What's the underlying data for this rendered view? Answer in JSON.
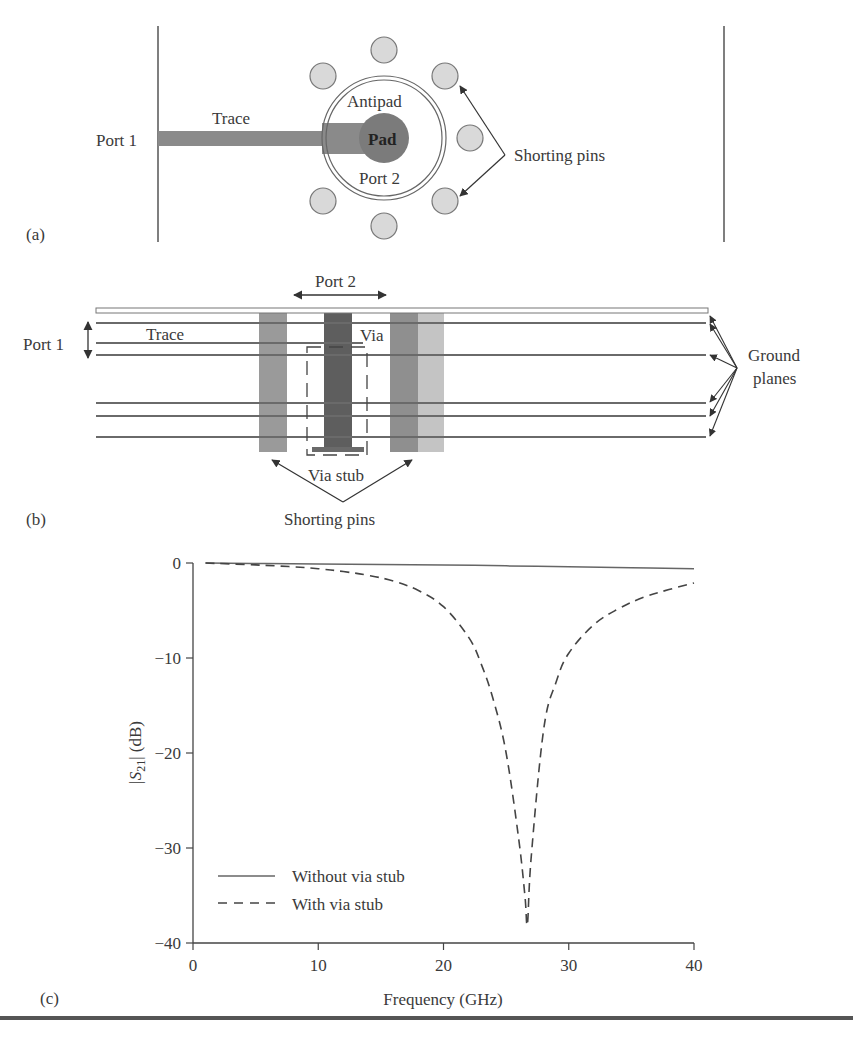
{
  "panel_a": {
    "label": "(a)",
    "port1": "Port 1",
    "trace": "Trace",
    "antipad": "Antipad",
    "pad": "Pad",
    "port2": "Port 2",
    "shorting_pins": "Shorting pins"
  },
  "panel_b": {
    "label": "(b)",
    "port1": "Port 1",
    "port2": "Port 2",
    "trace": "Trace",
    "via": "Via",
    "via_stub": "Via stub",
    "shorting_pins": "Shorting pins",
    "ground_planes_line1": "Ground",
    "ground_planes_line2": "planes"
  },
  "panel_c": {
    "label": "(c)",
    "ylabel_prefix": "|S",
    "ylabel_sub": "21",
    "ylabel_suffix": "| (dB)",
    "xlabel": "Frequency (GHz)",
    "xticks": [
      "0",
      "10",
      "20",
      "30",
      "40"
    ],
    "yticks": [
      "0",
      "−10",
      "−20",
      "−30",
      "−40"
    ],
    "legend": [
      {
        "label": "Without via stub",
        "style": "solid"
      },
      {
        "label": "With via stub",
        "style": "dashed"
      }
    ]
  },
  "chart_data": {
    "type": "line",
    "title": "",
    "xlabel": "Frequency (GHz)",
    "ylabel": "|S21| (dB)",
    "xlim": [
      0,
      40
    ],
    "ylim": [
      -40,
      0
    ],
    "grid": false,
    "legend_position": "lower left",
    "series": [
      {
        "name": "Without via stub",
        "style": "solid",
        "x": [
          1,
          5,
          10,
          15,
          20,
          25,
          30,
          35,
          40
        ],
        "y": [
          0,
          -0.05,
          -0.1,
          -0.15,
          -0.2,
          -0.3,
          -0.4,
          -0.5,
          -0.6
        ]
      },
      {
        "name": "With via stub",
        "style": "dashed",
        "x": [
          1,
          5,
          8,
          10,
          12,
          14,
          16,
          18,
          20,
          22,
          23,
          24,
          25,
          26,
          26.5,
          26.7,
          27,
          28,
          29,
          30,
          32,
          34,
          36,
          38,
          40
        ],
        "y": [
          0,
          -0.2,
          -0.4,
          -0.6,
          -0.9,
          -1.3,
          -1.9,
          -2.9,
          -4.6,
          -7.8,
          -10.6,
          -14.5,
          -20,
          -29,
          -35,
          -38,
          -31,
          -17.5,
          -12.5,
          -9.5,
          -6.5,
          -4.8,
          -3.6,
          -2.8,
          -2.1
        ]
      }
    ]
  }
}
